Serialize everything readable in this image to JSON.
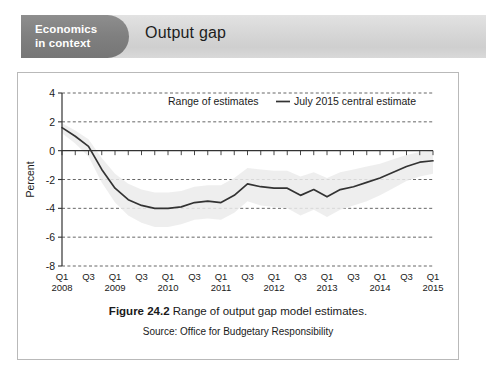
{
  "header": {
    "badge_line1": "Economics",
    "badge_line2": "in context",
    "title": "Output gap",
    "badge_color": "#7f7f7f",
    "band_color": "#d6d6d6"
  },
  "caption": {
    "figure_number": "Figure 24.2",
    "figure_text": "Range of output gap model estimates.",
    "source": "Source: Office for Budgetary Responsibility"
  },
  "chart_data": {
    "type": "line",
    "title": "",
    "xlabel": "",
    "ylabel": "Percent",
    "ylim": [
      -8,
      4
    ],
    "yticks": [
      4,
      2,
      0,
      -2,
      -4,
      -6,
      -8
    ],
    "ytick_labels": [
      "4",
      "2",
      "0",
      "-2",
      "-4",
      "-6",
      "-8"
    ],
    "grid": true,
    "grid_style": "dashed",
    "legend_position": "top-center",
    "legend": [
      {
        "label": "Range of estimates",
        "type": "band",
        "color": "#ebebeb"
      },
      {
        "label": "July 2015 central estimate",
        "type": "line",
        "color": "#333333"
      }
    ],
    "x": [
      "Q1 2008",
      "Q2 2008",
      "Q3 2008",
      "Q4 2008",
      "Q1 2009",
      "Q2 2009",
      "Q3 2009",
      "Q4 2009",
      "Q1 2010",
      "Q2 2010",
      "Q3 2010",
      "Q4 2010",
      "Q1 2011",
      "Q2 2011",
      "Q3 2011",
      "Q4 2011",
      "Q1 2012",
      "Q2 2012",
      "Q3 2012",
      "Q4 2012",
      "Q1 2013",
      "Q2 2013",
      "Q3 2013",
      "Q4 2013",
      "Q1 2014",
      "Q2 2014",
      "Q3 2014",
      "Q4 2014",
      "Q1 2015"
    ],
    "xtick_labels": [
      {
        "q": "Q1",
        "year": "2008"
      },
      {
        "q": "Q3",
        "year": ""
      },
      {
        "q": "Q1",
        "year": "2009"
      },
      {
        "q": "Q3",
        "year": ""
      },
      {
        "q": "Q1",
        "year": "2010"
      },
      {
        "q": "Q3",
        "year": ""
      },
      {
        "q": "Q1",
        "year": "2011"
      },
      {
        "q": "Q3",
        "year": ""
      },
      {
        "q": "Q1",
        "year": "2012"
      },
      {
        "q": "Q3",
        "year": ""
      },
      {
        "q": "Q1",
        "year": "2013"
      },
      {
        "q": "Q3",
        "year": ""
      },
      {
        "q": "Q1",
        "year": "2014"
      },
      {
        "q": "Q3",
        "year": ""
      },
      {
        "q": "Q1",
        "year": "2015"
      }
    ],
    "series": [
      {
        "name": "July 2015 central estimate",
        "color": "#333333",
        "values": [
          1.6,
          1.0,
          0.3,
          -1.3,
          -2.6,
          -3.4,
          -3.8,
          -4.0,
          -4.0,
          -3.9,
          -3.6,
          -3.5,
          -3.6,
          -3.1,
          -2.3,
          -2.5,
          -2.6,
          -2.6,
          -3.1,
          -2.7,
          -3.2,
          -2.7,
          -2.5,
          -2.2,
          -1.9,
          -1.5,
          -1.1,
          -0.8,
          -0.7
        ]
      }
    ],
    "band": {
      "name": "Range of estimates",
      "color": "#ebebeb",
      "upper": [
        1.9,
        1.4,
        0.8,
        -0.5,
        -1.6,
        -2.3,
        -2.7,
        -2.9,
        -2.9,
        -2.8,
        -2.5,
        -2.4,
        -2.4,
        -1.9,
        -1.2,
        -1.3,
        -1.4,
        -1.4,
        -1.8,
        -1.5,
        -1.9,
        -1.5,
        -1.3,
        -1.1,
        -0.9,
        -0.6,
        -0.3,
        -0.1,
        0.0
      ],
      "lower": [
        1.2,
        0.5,
        -0.4,
        -2.2,
        -3.6,
        -4.5,
        -5.0,
        -5.3,
        -5.3,
        -5.1,
        -4.8,
        -4.7,
        -4.8,
        -4.3,
        -3.5,
        -3.8,
        -3.9,
        -4.0,
        -4.5,
        -4.1,
        -4.6,
        -4.1,
        -3.8,
        -3.5,
        -3.1,
        -2.6,
        -2.1,
        -1.8,
        -1.6
      ]
    }
  }
}
